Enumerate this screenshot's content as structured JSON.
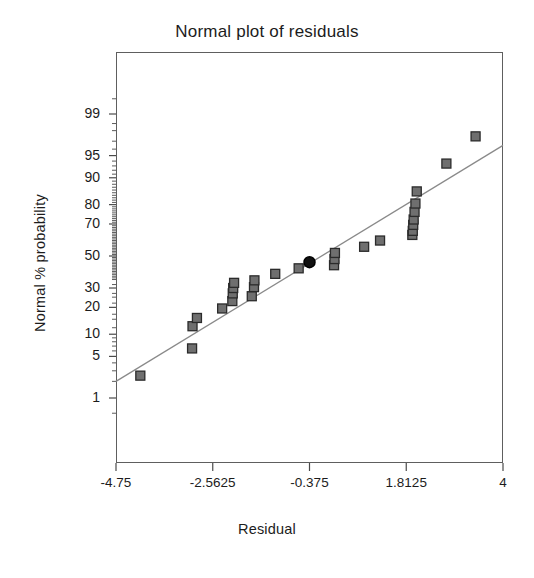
{
  "chart_data": {
    "type": "scatter",
    "title": "Normal plot of residuals",
    "xlabel": "Residual",
    "ylabel": "Normal % probability",
    "grid": false,
    "legend": null,
    "xlim": [
      -4.75,
      4.0
    ],
    "x_ticks": [
      {
        "label": "-4.75",
        "value": -4.75
      },
      {
        "label": "-2.5625",
        "value": -2.5625
      },
      {
        "label": "-0.375",
        "value": -0.375
      },
      {
        "label": "1.8125",
        "value": 1.8125
      },
      {
        "label": "4",
        "value": 4
      }
    ],
    "y_scale": "normal-probability",
    "y_ticks": [
      {
        "label": "99",
        "value": 99
      },
      {
        "label": "95",
        "value": 95
      },
      {
        "label": "90",
        "value": 90
      },
      {
        "label": "80",
        "value": 80
      },
      {
        "label": "70",
        "value": 70
      },
      {
        "label": "50",
        "value": 50
      },
      {
        "label": "30",
        "value": 30
      },
      {
        "label": "20",
        "value": 20
      },
      {
        "label": "10",
        "value": 10
      },
      {
        "label": "5",
        "value": 5
      },
      {
        "label": "1",
        "value": 1
      }
    ],
    "reference_line": {
      "x_start": -4.75,
      "y_start": 2.0,
      "x_end": 4.0,
      "y_end": 96.5,
      "color": "#8a8a8a"
    },
    "marker": {
      "shape": "square",
      "fill": "#6f6f6f",
      "edge": "#2b2b2b",
      "size_px": 9
    },
    "highlight_marker": {
      "shape": "circle",
      "fill": "#111111",
      "edge": "#000000",
      "size_px": 11,
      "x": -0.375,
      "y": 46
    },
    "points": [
      {
        "x": -4.2,
        "y": 2.5
      },
      {
        "x": -3.03,
        "y": 6.5
      },
      {
        "x": -3.02,
        "y": 12.5
      },
      {
        "x": -2.92,
        "y": 15.5
      },
      {
        "x": -2.35,
        "y": 19.5
      },
      {
        "x": -2.12,
        "y": 23.0
      },
      {
        "x": -2.11,
        "y": 27.0
      },
      {
        "x": -2.1,
        "y": 30.0
      },
      {
        "x": -2.08,
        "y": 33.0
      },
      {
        "x": -1.68,
        "y": 25.5
      },
      {
        "x": -1.63,
        "y": 30.5
      },
      {
        "x": -1.62,
        "y": 34.5
      },
      {
        "x": -1.15,
        "y": 38.5
      },
      {
        "x": -0.62,
        "y": 42.0
      },
      {
        "x": -0.375,
        "y": 46.0
      },
      {
        "x": 0.18,
        "y": 44.0
      },
      {
        "x": 0.19,
        "y": 48.0
      },
      {
        "x": 0.2,
        "y": 52.0
      },
      {
        "x": 0.86,
        "y": 56.0
      },
      {
        "x": 1.22,
        "y": 60.0
      },
      {
        "x": 1.95,
        "y": 63.5
      },
      {
        "x": 1.96,
        "y": 66.0
      },
      {
        "x": 1.97,
        "y": 69.5
      },
      {
        "x": 1.98,
        "y": 72.5
      },
      {
        "x": 2.0,
        "y": 76.5
      },
      {
        "x": 2.02,
        "y": 80.5
      },
      {
        "x": 2.05,
        "y": 85.5
      },
      {
        "x": 2.72,
        "y": 93.5
      },
      {
        "x": 3.38,
        "y": 97.5
      }
    ]
  }
}
